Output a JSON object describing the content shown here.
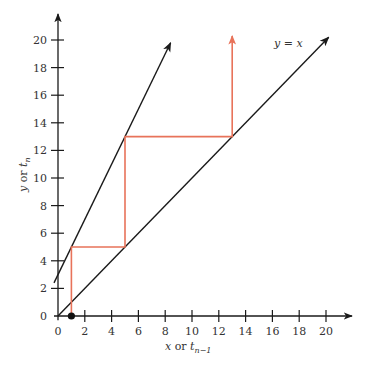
{
  "chart_data": {
    "type": "line",
    "title": "",
    "xlabel": "x or t_{n-1}",
    "ylabel": "y or t_n",
    "xlim": [
      0,
      20
    ],
    "ylim": [
      0,
      20
    ],
    "grid": false,
    "x_ticks": [
      0,
      2,
      4,
      6,
      8,
      10,
      12,
      14,
      16,
      18,
      20
    ],
    "y_ticks": [
      0,
      2,
      4,
      6,
      8,
      10,
      12,
      14,
      16,
      18,
      20
    ],
    "series": [
      {
        "name": "y = x",
        "color": "#1a1a1a",
        "x": [
          0,
          20.2
        ],
        "y": [
          0,
          20.2
        ],
        "arrow_end": true
      },
      {
        "name": "y = 2x + 3",
        "color": "#1a1a1a",
        "x": [
          -0.3,
          8.4
        ],
        "y": [
          2.4,
          19.8
        ],
        "arrow_end": true
      },
      {
        "name": "cobweb",
        "color": "#e8735a",
        "x": [
          1,
          1,
          5,
          5,
          13,
          13
        ],
        "y": [
          0,
          5,
          5,
          13,
          13,
          20.3
        ],
        "arrow_end": true
      }
    ],
    "points": [
      {
        "x": 1,
        "y": 0,
        "label": "start",
        "color": "#111111"
      }
    ],
    "annotations": [
      {
        "text": "y = x",
        "x": 15.6,
        "y": 19.7
      }
    ]
  },
  "labels": {
    "x_axis_main": "x",
    "x_axis_or": " or ",
    "x_axis_t": "t",
    "x_axis_sub": "n−1",
    "y_axis_main": "y",
    "y_axis_or": " or ",
    "y_axis_t": "t",
    "y_axis_sub": "n",
    "line_label_y": "y",
    "line_label_eq": " = ",
    "line_label_x": "x"
  },
  "x_tick_labels": [
    "0",
    "2",
    "4",
    "6",
    "8",
    "10",
    "12",
    "14",
    "16",
    "18",
    "20"
  ],
  "y_tick_labels": [
    "0",
    "2",
    "4",
    "6",
    "8",
    "10",
    "12",
    "14",
    "16",
    "18",
    "20"
  ]
}
